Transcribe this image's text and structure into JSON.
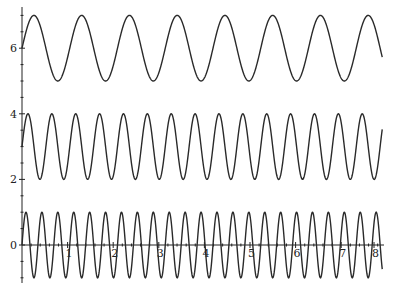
{
  "chart_data": {
    "type": "line",
    "title": "",
    "xlabel": "",
    "ylabel": "",
    "xlim": [
      0,
      8.3
    ],
    "ylim": [
      -1.1,
      7.2
    ],
    "grid": false,
    "legend": null,
    "x_ticks": [
      {
        "value": 1,
        "label": "1"
      },
      {
        "value": 2,
        "label": "2"
      },
      {
        "value": 3,
        "label": "3"
      },
      {
        "value": 4,
        "label": "4"
      },
      {
        "value": 5,
        "label": "5"
      },
      {
        "value": 6,
        "label": "6"
      },
      {
        "value": 7,
        "label": "7"
      },
      {
        "value": 8,
        "label": "8"
      }
    ],
    "y_ticks": [
      {
        "value": 0,
        "label": "0"
      },
      {
        "value": 2,
        "label": "2"
      },
      {
        "value": 4,
        "label": "4"
      },
      {
        "value": 6,
        "label": "6"
      }
    ],
    "series": [
      {
        "name": "6 + sin(6x)",
        "offset": 6,
        "amplitude": 1,
        "frequency": 6,
        "x_range": [
          0,
          7.9
        ]
      },
      {
        "name": "3 + sin(12x)",
        "offset": 3,
        "amplitude": 1,
        "frequency": 12,
        "x_range": [
          0,
          7.9
        ]
      },
      {
        "name": "sin(18x)",
        "offset": 0,
        "amplitude": 1,
        "frequency": 18,
        "x_range": [
          0,
          7.9
        ]
      }
    ],
    "line_color": "#2a2a2a"
  }
}
